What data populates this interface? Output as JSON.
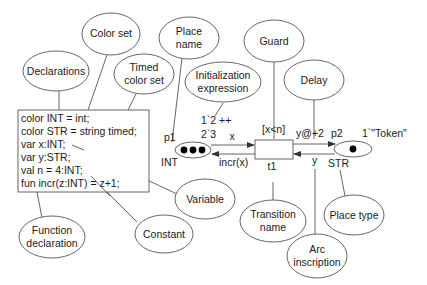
{
  "diagram": {
    "callouts": {
      "color_set": "Color set",
      "declarations": "Declarations",
      "timed_color_set_1": "Timed",
      "timed_color_set_2": "color set",
      "place_name_1": "Place",
      "place_name_2": "name",
      "init_expr_1": "Initialization",
      "init_expr_2": "expression",
      "guard": "Guard",
      "delay": "Delay",
      "variable": "Variable",
      "constant": "Constant",
      "function_decl_1": "Function",
      "function_decl_2": "declaration",
      "transition_name_1": "Transition",
      "transition_name_2": "name",
      "place_type": "Place type",
      "arc_inscription_1": "Arc",
      "arc_inscription_2": "inscription"
    },
    "declarations_box": {
      "lines": [
        "color INT = int;",
        "color STR = string timed;",
        "var x:INT;",
        "var y:STR;",
        "val n = 4:INT;",
        "fun incr(z:INT) = z+1;"
      ]
    },
    "net": {
      "place_p1": {
        "name": "p1",
        "type": "INT",
        "init_line1": "1`2 ++",
        "init_line2": "2`3",
        "tokens": 3
      },
      "transition_t1": {
        "name": "t1",
        "guard": "[x<n]"
      },
      "place_p2": {
        "name": "p2",
        "type": "STR",
        "init": "1`\"Token\"",
        "tokens": 1
      },
      "arcs": {
        "p1_to_t1": "x",
        "t1_to_p1": "incr(x)",
        "t1_to_p2": "y@+2",
        "p2_to_t1": "y"
      }
    },
    "colors": {
      "stroke": "#555555",
      "text": "#1a1a1a",
      "token": "#000000",
      "background": "#ffffff"
    }
  }
}
